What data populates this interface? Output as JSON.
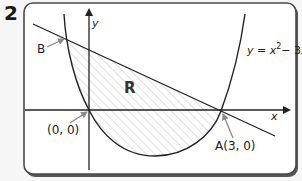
{
  "question": {
    "number": "2"
  },
  "diagram": {
    "curve_equation_label": "y = x² − 3x",
    "curve_equation_parts": {
      "lhs": "y",
      "eq": " = ",
      "x": "x",
      "exp": "2",
      "rest": "− 3",
      "x2": "x"
    },
    "axis_labels": {
      "x": "x",
      "y": "y"
    },
    "region_label": "R",
    "points": [
      {
        "name": "B",
        "label": "B"
      },
      {
        "name": "origin",
        "label": "(0, 0)"
      },
      {
        "name": "A",
        "label": "A(3, 0)"
      }
    ],
    "colors": {
      "frame_border": "#4a4a4a",
      "frame_fill": "#ffffff",
      "background": "#f6f6f6",
      "curve": "#222222",
      "hatch": "#c4c4c4",
      "pointer_arrow": "#8a8a8a"
    }
  }
}
